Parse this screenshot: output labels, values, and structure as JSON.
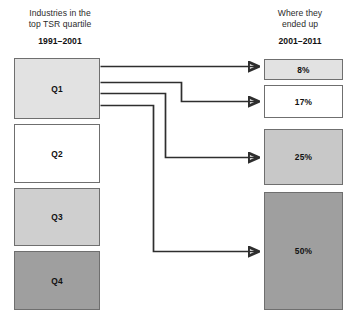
{
  "left_column": {
    "title_line1": "Industries in the",
    "title_line2": "top TSR quartile",
    "period": "1991–2001",
    "boxes": [
      {
        "label": "Q1",
        "fill": "#e2e2e2",
        "x": 14,
        "y": 58,
        "w": 86,
        "h": 61
      },
      {
        "label": "Q2",
        "fill": "#ffffff",
        "x": 14,
        "y": 124,
        "w": 86,
        "h": 59
      },
      {
        "label": "Q3",
        "fill": "#cfcfcf",
        "x": 14,
        "y": 188,
        "w": 86,
        "h": 58
      },
      {
        "label": "Q4",
        "fill": "#9f9f9f",
        "x": 14,
        "y": 251,
        "w": 86,
        "h": 59
      }
    ]
  },
  "right_column": {
    "title_line1": "Where they",
    "title_line2": "ended up",
    "period": "2001–2011",
    "boxes": [
      {
        "label": "8%",
        "fill": "#e2e2e2",
        "x": 264,
        "y": 59,
        "w": 79,
        "h": 21
      },
      {
        "label": "17%",
        "fill": "#ffffff",
        "x": 264,
        "y": 85,
        "w": 79,
        "h": 33
      },
      {
        "label": "25%",
        "fill": "#c8c8c8",
        "x": 264,
        "y": 129,
        "w": 79,
        "h": 56
      },
      {
        "label": "50%",
        "fill": "#9f9f9f",
        "x": 264,
        "y": 192,
        "w": 79,
        "h": 118
      }
    ]
  },
  "chart_data": {
    "type": "diagram",
    "source_period": "1991–2001",
    "target_period": "2001–2011",
    "source_categories": [
      "Q1",
      "Q2",
      "Q3",
      "Q4"
    ],
    "target_categories": [
      "8%",
      "17%",
      "25%",
      "50%"
    ],
    "values": [
      8,
      17,
      25,
      50
    ],
    "unit": "percent",
    "flows": [
      {
        "from": "Q1",
        "to": "8%",
        "value": 8
      },
      {
        "from": "Q1",
        "to": "17%",
        "value": 17
      },
      {
        "from": "Q1",
        "to": "25%",
        "value": 25
      },
      {
        "from": "Q1",
        "to": "50%",
        "value": 50
      }
    ],
    "note": "All four flows originate from the Q1 box; target box heights are proportional to the percentages."
  },
  "connector_paths": [
    "M 100.5 66.5 L 258 66.5",
    "M 100.5 82.5 L 181.5 82.5 L 181.5 101.5 L 258 101.5",
    "M 100.5 93.5 L 165.5 93.5 L 165.5 157.5 L 258 157.5",
    "M 100.5 105.5 L 153.5 105.5 L 153.5 251.5 L 258 251.5"
  ]
}
